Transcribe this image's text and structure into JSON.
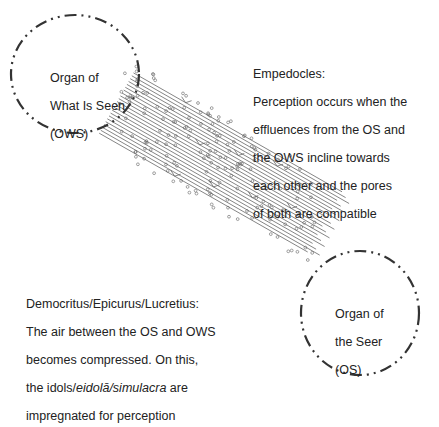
{
  "nodes": {
    "ows": {
      "label_lines": [
        "Organ of",
        "What Is Seen",
        "(OWS)"
      ],
      "cx": 75,
      "cy": 74,
      "rx": 64,
      "ry": 59
    },
    "os": {
      "label_lines": [
        "Organ of",
        "the Seer",
        "(OS)"
      ],
      "cx": 360,
      "cy": 313,
      "rx": 59,
      "ry": 62
    }
  },
  "annotations": {
    "empedocles": {
      "title": "Empedocles:",
      "lines": [
        "Perception occurs when the",
        "effluences from the OS and",
        "the OWS incline towards",
        "each other and the pores",
        "of both are compatible"
      ]
    },
    "democritus": {
      "title": "Democritus/Epicurus/Lucretius:",
      "line1": "The air between the OS and OWS",
      "line2": "becomes compressed. On this,",
      "line3_pre": "the idols/",
      "line3_italic": "eidolā/simulacra",
      "line3_post": " are",
      "line4": "impregnated for perception"
    }
  },
  "colors": {
    "stroke": "#333333",
    "line": "#555555",
    "dot": "#777777",
    "text": "#222222"
  }
}
